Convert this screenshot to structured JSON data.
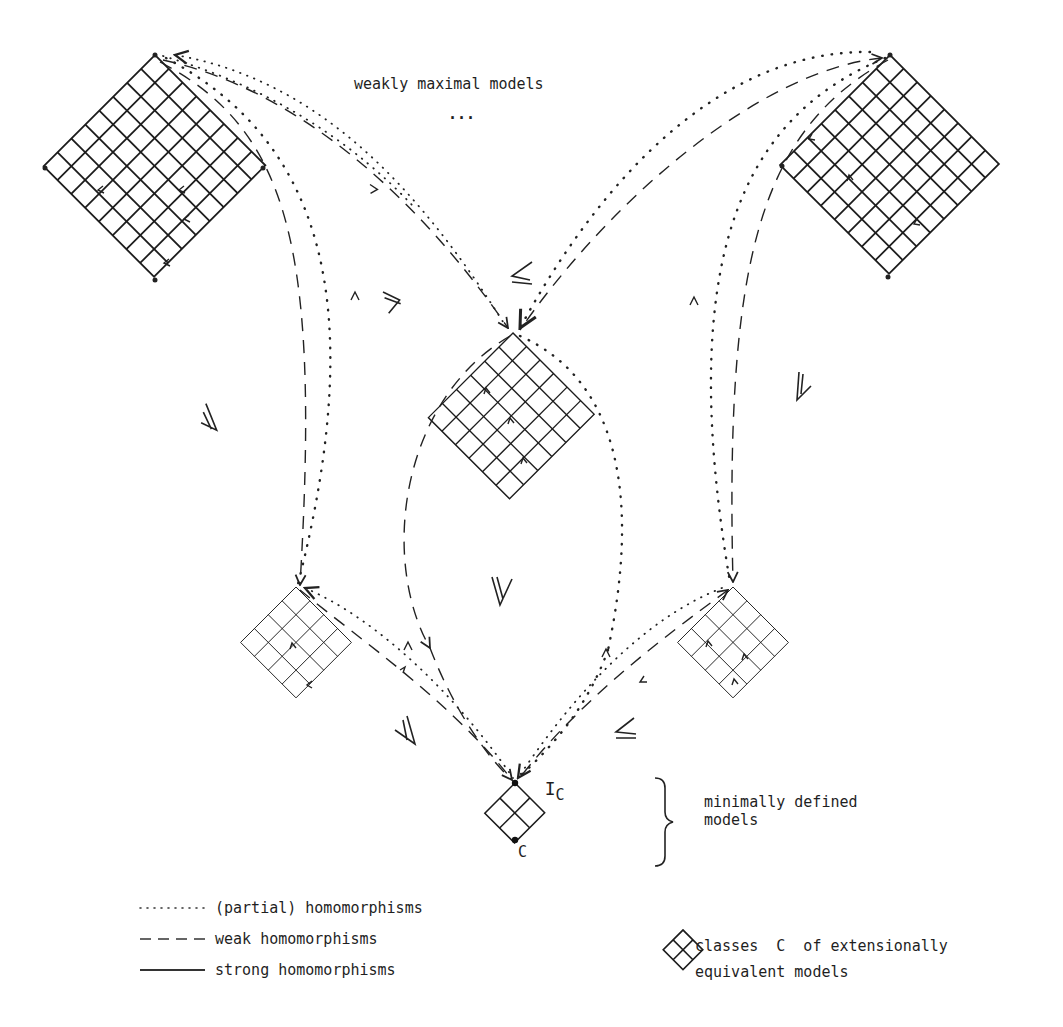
{
  "title_label": "weakly maximal models",
  "ellipsis": "...",
  "minimal": {
    "line1": "minimally defined",
    "line2": "models",
    "top_point_label": "I",
    "top_point_subscript": "C",
    "bottom_point_label": "C"
  },
  "legend": {
    "items": [
      {
        "style": "dotted",
        "label": "(partial) homomorphisms"
      },
      {
        "style": "dashed",
        "label": "weak homomorphisms"
      },
      {
        "style": "solid",
        "label": "strong homomorphisms"
      }
    ],
    "class_symbol": {
      "icon": "diamond-2x2-grid-icon",
      "line1": "classes  C  of extensionally",
      "line2": "equivalent models"
    }
  },
  "nodes": [
    {
      "id": "top-left",
      "grid": 8
    },
    {
      "id": "top-right",
      "grid": 8
    },
    {
      "id": "center",
      "grid": 6
    },
    {
      "id": "lower-left",
      "grid": 4
    },
    {
      "id": "lower-right",
      "grid": 4
    },
    {
      "id": "bottom",
      "grid": 2
    }
  ],
  "relation_symbols": [
    "≥",
    "≤",
    "≥",
    "≥",
    "≥",
    "≥",
    "≤"
  ]
}
